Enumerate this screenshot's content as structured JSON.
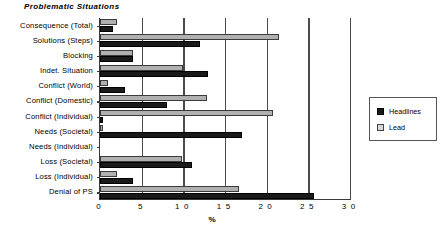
{
  "chart_data": {
    "type": "bar",
    "orientation": "horizontal",
    "title": "Problematic Situations",
    "xlabel": "%",
    "ylabel": "",
    "xlim": [
      0,
      30
    ],
    "xticks": [
      0,
      5,
      10,
      15,
      20,
      25,
      30
    ],
    "xtick_labels": [
      "0",
      "5",
      "1 0",
      "1 5",
      "2 0",
      "2 5",
      "3 0"
    ],
    "grid": true,
    "legend_position": "right",
    "categories": [
      "Consequence (Total)",
      "Solutions  (Steps)",
      "Blocking",
      "Indet.  Situation",
      "Conflict  (World)",
      "Conflict  (Domestic)",
      "Conflict  (Individual)",
      "Needs (Societal)",
      "Needs  (Individual)",
      "Loss (Societal)",
      "Loss  (Individual)",
      "Denial of PS"
    ],
    "series": [
      {
        "name": "Headlines",
        "color": "#1a1a1a",
        "values": [
          1.5,
          12.0,
          4.0,
          13.0,
          3.0,
          8.0,
          0.3,
          17.0,
          0.0,
          11.0,
          4.0,
          25.7
        ]
      },
      {
        "name": "Lead",
        "color": "#b0b0b0",
        "values": [
          2.0,
          21.5,
          4.0,
          10.0,
          1.0,
          12.8,
          20.8,
          0.3,
          0.0,
          9.8,
          2.0,
          16.7
        ]
      }
    ]
  },
  "legend": {
    "entries": [
      {
        "label": "Headlines",
        "swatch": "headlines"
      },
      {
        "label": "Lead",
        "swatch": "lead"
      }
    ]
  },
  "colors": {
    "headlines": "#1a1a1a",
    "lead": "#b0b0b0",
    "axis": "#3a3a3a",
    "grid": "#4a4a4a",
    "background": "#ffffff"
  }
}
